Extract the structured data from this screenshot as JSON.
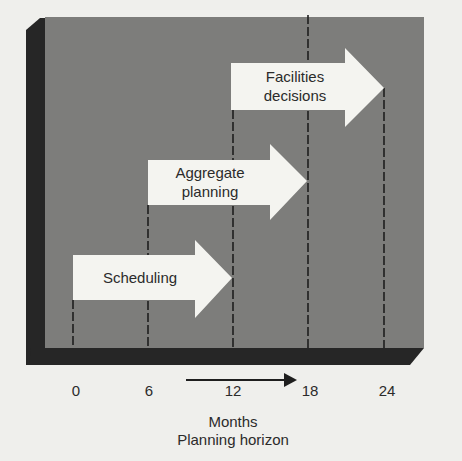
{
  "diagram": {
    "arrows": [
      {
        "label_lines": [
          "Scheduling"
        ],
        "start_month": 0,
        "end_month": 12
      },
      {
        "label_lines": [
          "Aggregate",
          "planning"
        ],
        "start_month": 6,
        "end_month": 18
      },
      {
        "label_lines": [
          "Facilities",
          "decisions"
        ],
        "start_month": 12,
        "end_month": 24
      }
    ],
    "axis": {
      "ticks": [
        "0",
        "6",
        "12",
        "18",
        "24"
      ],
      "unit_label": "Months",
      "title": "Planning horizon"
    },
    "colors": {
      "panel": "#7d7d7b",
      "panel_edge": "#262626",
      "arrow_fill": "#f4f4f0",
      "dashed_line": "#1e1e1e",
      "text": "#2b2b2b",
      "background": "#efefec"
    }
  }
}
